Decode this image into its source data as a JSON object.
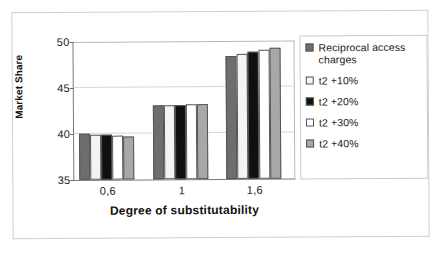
{
  "chart_data": {
    "type": "bar",
    "title": "",
    "xlabel": "Degree of substitutability",
    "ylabel": "Market Share",
    "categories": [
      "0,6",
      "1",
      "1,6"
    ],
    "ylim": [
      35,
      50
    ],
    "yticks": [
      35,
      40,
      45,
      50
    ],
    "grid": true,
    "legend_position": "right",
    "series": [
      {
        "name": "Reciprocal access charges",
        "color": "#6e6e6e",
        "values": [
          39.95,
          43.0,
          48.4
        ]
      },
      {
        "name": "t2 +10%",
        "color": "#f4f4f4",
        "values": [
          39.9,
          43.05,
          48.55
        ]
      },
      {
        "name": "t2 +20%",
        "color": "#101010",
        "values": [
          39.85,
          43.05,
          48.85
        ]
      },
      {
        "name": "t2 +30%",
        "color": "#ffffff",
        "values": [
          39.8,
          43.1,
          49.05
        ]
      },
      {
        "name": "t2 +40%",
        "color": "#a8a8a8",
        "values": [
          39.7,
          43.15,
          49.2
        ]
      }
    ]
  },
  "legend": {
    "entries": [
      {
        "label": "Reciprocal access charges",
        "swatch": "#6e6e6e"
      },
      {
        "label": "t2 +10%",
        "swatch": "#f4f4f4"
      },
      {
        "label": "t2 +20%",
        "swatch": "#101010"
      },
      {
        "label": "t2 +30%",
        "swatch": "#ffffff"
      },
      {
        "label": "t2 +40%",
        "swatch": "#a8a8a8"
      }
    ]
  }
}
